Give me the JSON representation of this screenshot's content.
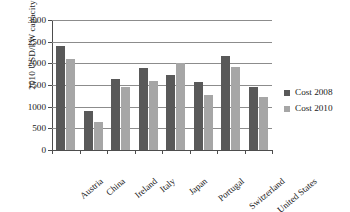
{
  "chart_data": {
    "type": "bar",
    "title": "",
    "xlabel": "",
    "ylabel": "2010 USD/kW capacity",
    "ylim": [
      0,
      3000
    ],
    "ytick_step": 500,
    "yticks": [
      3000,
      2500,
      2000,
      1500,
      1000,
      500,
      0
    ],
    "ytick_labels": [
      "3000",
      "2500",
      "2000",
      "1500",
      "1000",
      "500",
      "0"
    ],
    "grid": true,
    "grid_axis": "y",
    "legend_position": "right",
    "categories": [
      "Austria",
      "China",
      "Ireland",
      "Italy",
      "Japan",
      "Portugal",
      "Switzerland",
      "United States"
    ],
    "series": [
      {
        "name": "Cost 2008",
        "color": "#595959",
        "values": [
          2390,
          900,
          1640,
          1890,
          1720,
          1580,
          2160,
          1460
        ]
      },
      {
        "name": "Cost 2010",
        "color": "#a6a6a6",
        "values": [
          2110,
          640,
          1450,
          1600,
          2000,
          1260,
          1910,
          1230
        ]
      }
    ]
  },
  "legend": {
    "items": [
      {
        "label": "Cost 2008",
        "color": "#595959"
      },
      {
        "label": "Cost 2010",
        "color": "#a6a6a6"
      }
    ]
  },
  "colors": {
    "series_2008": "#595959",
    "series_2010": "#a6a6a6",
    "axis": "#4d4d4d",
    "gridline": "#8c8c8c",
    "background": "#ffffff"
  }
}
